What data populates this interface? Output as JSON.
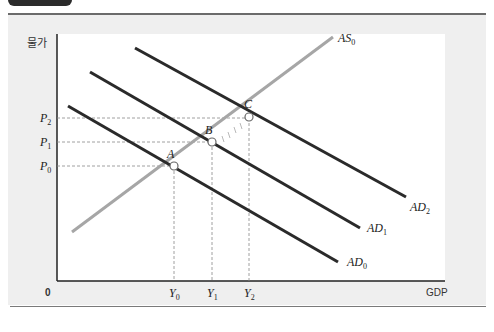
{
  "axes": {
    "y_label": "물가",
    "x_label": "GDP",
    "origin_label": "0"
  },
  "price_levels": [
    {
      "base": "P",
      "sub": "0"
    },
    {
      "base": "P",
      "sub": "1"
    },
    {
      "base": "P",
      "sub": "2"
    }
  ],
  "output_levels": [
    {
      "base": "Y",
      "sub": "0"
    },
    {
      "base": "Y",
      "sub": "1"
    },
    {
      "base": "Y",
      "sub": "2"
    }
  ],
  "curves": {
    "as0": {
      "base": "AS",
      "sub": "0",
      "color": "#a6a6a6"
    },
    "ad0": {
      "base": "AD",
      "sub": "0",
      "color": "#2a2a2a"
    },
    "ad1": {
      "base": "AD",
      "sub": "1",
      "color": "#2a2a2a"
    },
    "ad2": {
      "base": "AD",
      "sub": "2",
      "color": "#2a2a2a"
    }
  },
  "points": {
    "a": "A",
    "b": "B",
    "c": "C"
  },
  "colors": {
    "panel": "#efefef",
    "plot": "#ffffff",
    "axis": "#222222",
    "guide": "#888888"
  }
}
